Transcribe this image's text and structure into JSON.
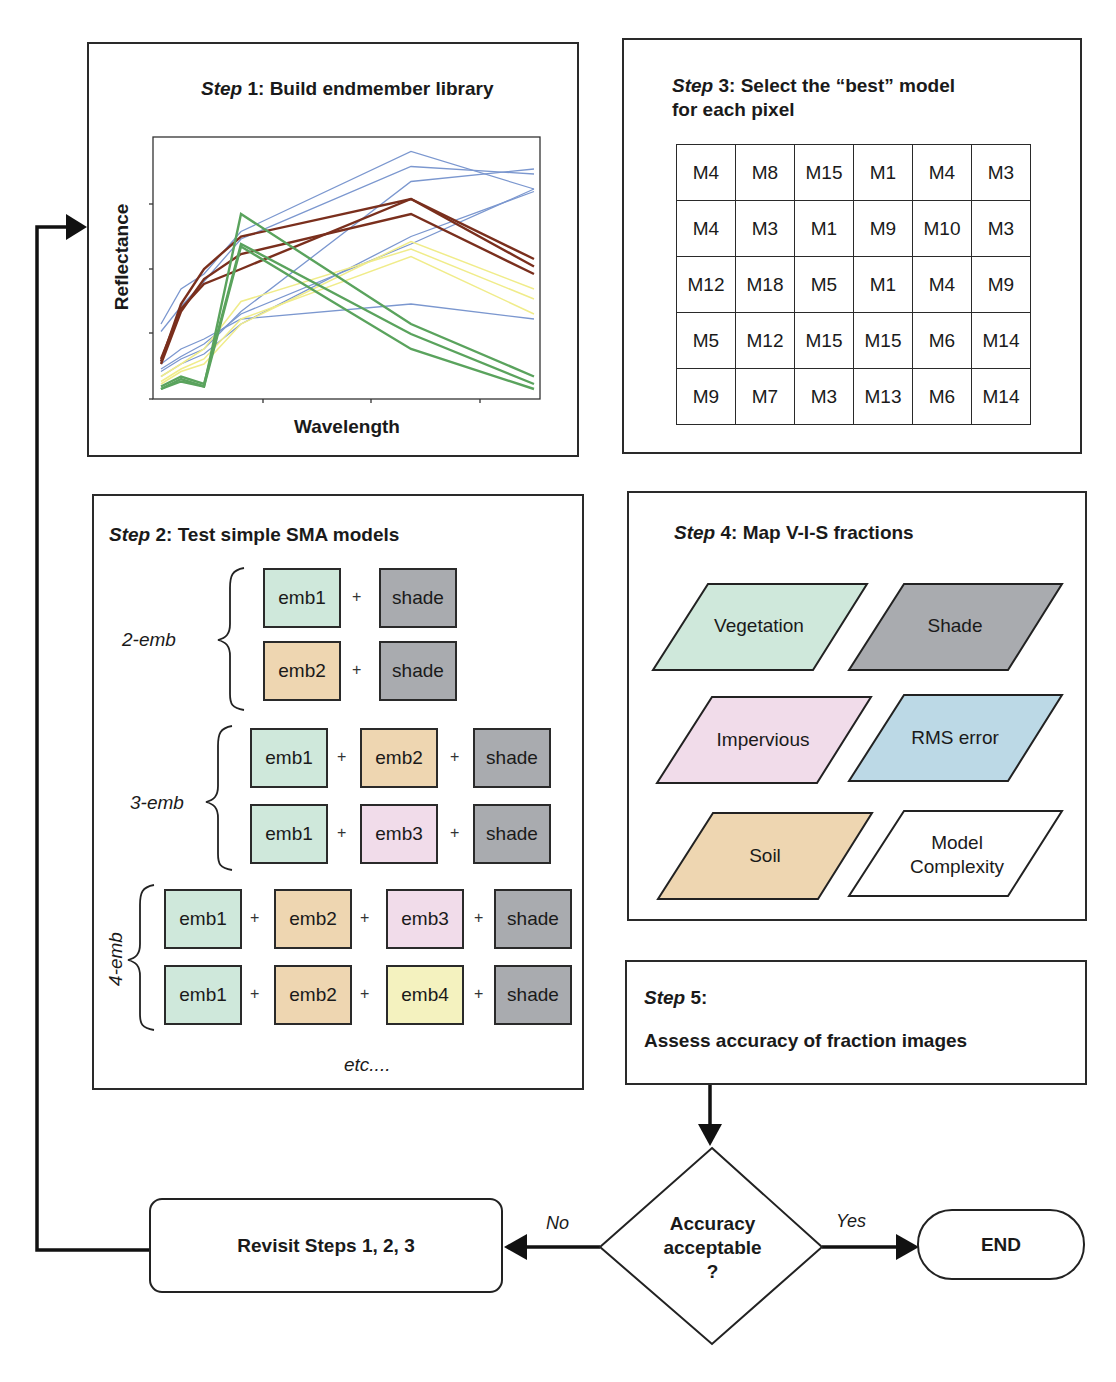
{
  "colors": {
    "vegetation": "#cfe8db",
    "soil": "#eed6b1",
    "impervious": "#f1dcea",
    "shade": "#a9abaf",
    "rms": "#bcd9e6",
    "emb4": "#f4f2bf",
    "spectra_blue": "#7b97cf",
    "spectra_brown": "#7a2f1d",
    "spectra_green": "#5aa35d",
    "spectra_yellow": "#f0ec8a"
  },
  "step1": {
    "step_word": "Step",
    "title_rest": " 1: Build endmember library",
    "xlabel": "Wavelength",
    "ylabel": "Reflectance"
  },
  "step2": {
    "step_word": "Step",
    "title_rest": " 2: Test simple SMA models",
    "groups": [
      {
        "label": "2-emb",
        "rows": [
          [
            "emb1",
            "shade"
          ],
          [
            "emb2",
            "shade"
          ]
        ]
      },
      {
        "label": "3-emb",
        "rows": [
          [
            "emb1",
            "emb2",
            "shade"
          ],
          [
            "emb1",
            "emb3",
            "shade"
          ]
        ]
      },
      {
        "label": "4-emb",
        "rows": [
          [
            "emb1",
            "emb2",
            "emb3",
            "shade"
          ],
          [
            "emb1",
            "emb2",
            "emb4",
            "shade"
          ]
        ]
      }
    ],
    "plus": "+",
    "etc": "etc...."
  },
  "step3": {
    "step_word": "Step",
    "title_line1_rest": " 3: Select the “best” model",
    "title_line2": "for each pixel",
    "grid": [
      [
        "M4",
        "M8",
        "M15",
        "M1",
        "M4",
        "M3"
      ],
      [
        "M4",
        "M3",
        "M1",
        "M9",
        "M10",
        "M3"
      ],
      [
        "M12",
        "M18",
        "M5",
        "M1",
        "M4",
        "M9"
      ],
      [
        "M5",
        "M12",
        "M15",
        "M15",
        "M6",
        "M14"
      ],
      [
        "M9",
        "M7",
        "M3",
        "M13",
        "M6",
        "M14"
      ]
    ]
  },
  "step4": {
    "step_word": "Step",
    "title_rest": " 4: Map V-I-S fractions",
    "fractions": [
      {
        "label": "Vegetation"
      },
      {
        "label": "Shade"
      },
      {
        "label": "Impervious"
      },
      {
        "label": "RMS error"
      },
      {
        "label": "Soil"
      },
      {
        "label": "Model Complexity"
      }
    ]
  },
  "step5": {
    "step_word": "Step",
    "title_rest": " 5:",
    "text": "Assess accuracy of fraction images"
  },
  "decision": {
    "line1": "Accuracy",
    "line2": "acceptable",
    "line3": "?",
    "no_label": "No",
    "yes_label": "Yes"
  },
  "revisit": {
    "label": "Revisit Steps 1, 2, 3"
  },
  "end": {
    "label": "END"
  },
  "chart_data": {
    "type": "line",
    "title": "Step 1: Build endmember library",
    "xlabel": "Wavelength",
    "ylabel": "Reflectance",
    "x": [
      1,
      2,
      3,
      4,
      5,
      6
    ],
    "grid": false,
    "legend": "none",
    "ylim": [
      0,
      1
    ],
    "series": [
      {
        "name": "blue-1",
        "color": "blue",
        "values": [
          0.28,
          0.42,
          0.48,
          0.65,
          0.97,
          0.82
        ]
      },
      {
        "name": "blue-2",
        "color": "blue",
        "values": [
          0.25,
          0.35,
          0.45,
          0.62,
          0.91,
          0.88
        ]
      },
      {
        "name": "blue-3",
        "color": "blue",
        "values": [
          0.12,
          0.18,
          0.22,
          0.3,
          0.36,
          0.3
        ]
      },
      {
        "name": "blue-4",
        "color": "blue",
        "values": [
          0.1,
          0.15,
          0.2,
          0.32,
          0.6,
          0.82
        ]
      },
      {
        "name": "blue-5",
        "color": "blue",
        "values": [
          0.09,
          0.14,
          0.18,
          0.33,
          0.85,
          0.9
        ]
      },
      {
        "name": "blue-6",
        "color": "blue",
        "values": [
          0.07,
          0.12,
          0.16,
          0.28,
          0.63,
          0.81
        ]
      },
      {
        "name": "brown-1",
        "color": "brown",
        "values": [
          0.13,
          0.36,
          0.5,
          0.63,
          0.78,
          0.54
        ]
      },
      {
        "name": "brown-2",
        "color": "brown",
        "values": [
          0.12,
          0.33,
          0.46,
          0.56,
          0.72,
          0.48
        ]
      },
      {
        "name": "brown-3",
        "color": "brown",
        "values": [
          0.14,
          0.34,
          0.44,
          0.5,
          0.78,
          0.51
        ]
      },
      {
        "name": "yellow-1",
        "color": "yellow",
        "values": [
          0.07,
          0.12,
          0.18,
          0.37,
          0.58,
          0.38
        ]
      },
      {
        "name": "yellow-2",
        "color": "yellow",
        "values": [
          0.05,
          0.1,
          0.14,
          0.3,
          0.55,
          0.32
        ]
      },
      {
        "name": "yellow-3",
        "color": "yellow",
        "values": [
          0.04,
          0.09,
          0.12,
          0.28,
          0.61,
          0.42
        ]
      },
      {
        "name": "green-1",
        "color": "green",
        "values": [
          0.02,
          0.06,
          0.03,
          0.72,
          0.28,
          0.07
        ]
      },
      {
        "name": "green-2",
        "color": "green",
        "values": [
          0.03,
          0.07,
          0.04,
          0.6,
          0.24,
          0.04
        ]
      },
      {
        "name": "green-3",
        "color": "green",
        "values": [
          0.02,
          0.05,
          0.03,
          0.59,
          0.18,
          0.02
        ]
      }
    ]
  }
}
